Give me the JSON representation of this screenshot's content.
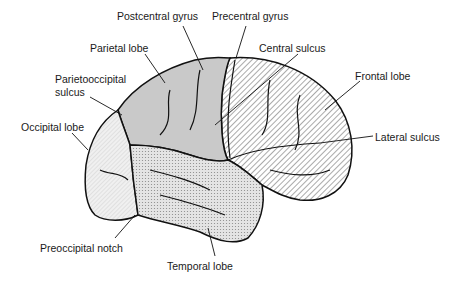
{
  "diagram": {
    "labels": [
      {
        "id": "postcentral-gyrus",
        "text": "Postcentral gyrus",
        "x": 117,
        "y": 15,
        "target": [
          203,
          70
        ]
      },
      {
        "id": "precentral-gyrus",
        "text": "Precentral gyrus",
        "x": 212,
        "y": 15,
        "target": [
          236,
          58
        ]
      },
      {
        "id": "parietal-lobe",
        "text": "Parietal lobe",
        "x": 90,
        "y": 42,
        "target": [
          165,
          83
        ]
      },
      {
        "id": "parietooccipital-sulcus",
        "text": "Parietooccipital",
        "text2": "sulcus",
        "x": 55,
        "y": 75,
        "target": [
          122,
          115
        ]
      },
      {
        "id": "occipital-lobe",
        "text": "Occipital lobe",
        "x": 21,
        "y": 122,
        "target": [
          88,
          150
        ]
      },
      {
        "id": "central-sulcus",
        "text": "Central sulcus",
        "x": 259,
        "y": 42,
        "target": [
          215,
          125
        ]
      },
      {
        "id": "frontal-lobe",
        "text": "Frontal lobe",
        "x": 355,
        "y": 69,
        "target": [
          325,
          110
        ]
      },
      {
        "id": "lateral-sulcus",
        "text": "Lateral sulcus",
        "x": 375,
        "y": 130,
        "target": [
          320,
          143
        ]
      },
      {
        "id": "preoccipital-notch",
        "text": "Preoccipital notch",
        "x": 40,
        "y": 241,
        "target": [
          135,
          215
        ]
      },
      {
        "id": "temporal-lobe",
        "text": "Temporal lobe",
        "x": 167,
        "y": 259,
        "target": [
          208,
          228
        ]
      }
    ],
    "regions": {
      "frontal": {
        "fill": "hatched",
        "color": "#222222"
      },
      "parietal": {
        "fill": "gray",
        "color": "#c8c8c8"
      },
      "temporal": {
        "fill": "dotted",
        "color": "#d8d8d8"
      },
      "occipital": {
        "fill": "light-hatched",
        "color": "#e6e6e6"
      }
    }
  }
}
